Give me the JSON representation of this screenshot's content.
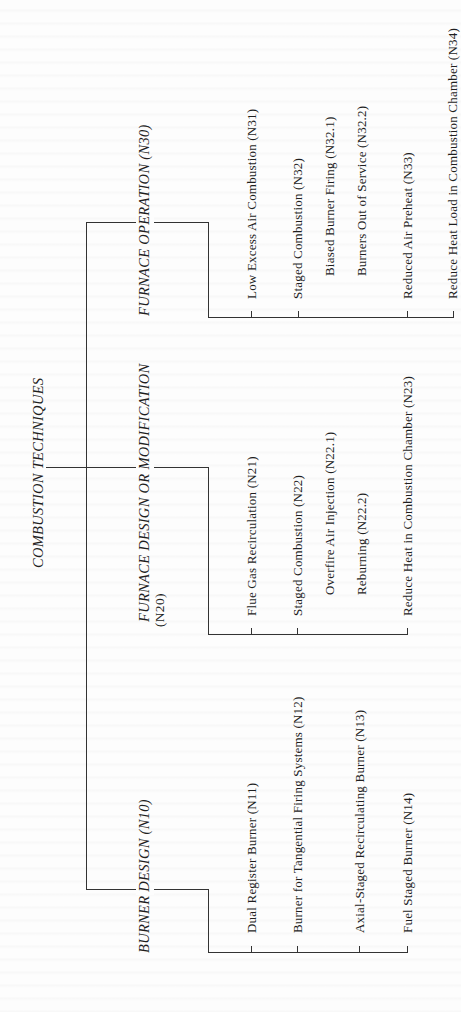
{
  "diagram": {
    "orientation": "rotated-90-ccw",
    "root": {
      "label": "COMBUSTION TECHNIQUES"
    },
    "branches": [
      {
        "id": "N30",
        "label": "FURNACE OPERATION (N30)",
        "children": [
          {
            "id": "N31",
            "label": "Low Excess Air Combustion (N31)",
            "level": 1
          },
          {
            "id": "N32",
            "label": "Staged Combustion (N32)",
            "level": 1
          },
          {
            "id": "N32.1",
            "label": "Biased Burner Firing (N32.1)",
            "level": 2
          },
          {
            "id": "N32.2",
            "label": "Burners Out of Service (N32.2)",
            "level": 2
          },
          {
            "id": "N33",
            "label": "Reduced Air Preheat (N33)",
            "level": 1
          },
          {
            "id": "N34",
            "label": "Reduce Heat Load in Combustion Chamber (N34)",
            "level": 1
          }
        ]
      },
      {
        "id": "N20",
        "label_line1": "FURNACE DESIGN OR MODIFICATION",
        "label_line2": "(N20)",
        "children": [
          {
            "id": "N21",
            "label": "Flue Gas Recirculation (N21)",
            "level": 1
          },
          {
            "id": "N22",
            "label": "Staged Combustion (N22)",
            "level": 1
          },
          {
            "id": "N22.1",
            "label": "Overfire Air Injection (N22.1)",
            "level": 2
          },
          {
            "id": "N22.2",
            "label": "Reburning (N22.2)",
            "level": 2
          },
          {
            "id": "N23",
            "label": "Reduce Heat in Combustion Chamber (N23)",
            "level": 1
          }
        ]
      },
      {
        "id": "N10",
        "label": "BURNER DESIGN (N10)",
        "children": [
          {
            "id": "N11",
            "label": "Dual Register Burner (N11)",
            "level": 1
          },
          {
            "id": "N12",
            "label": "Burner for Tangential Firing Systems (N12)",
            "level": 1
          },
          {
            "id": "N13",
            "label": "Axial-Staged Recirculating Burner (N13)",
            "level": 1
          },
          {
            "id": "N14",
            "label": "Fuel Staged Burner (N14)",
            "level": 1
          }
        ]
      }
    ]
  },
  "colors": {
    "line": "#333333",
    "text": "#1f1f1f",
    "background": "#fdfdfd"
  }
}
